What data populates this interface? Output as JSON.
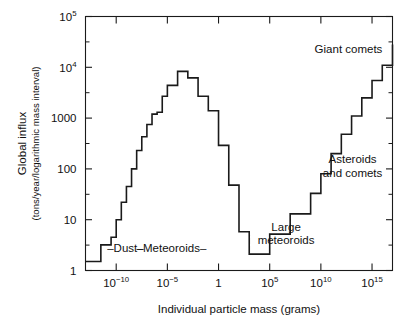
{
  "figure": {
    "background": "#ffffff",
    "line_color": "#1a1a1a",
    "axis_color": "#1a1a1a"
  },
  "chart_data": {
    "type": "line",
    "style": "step-histogram",
    "title": "",
    "xlabel": "Individual particle mass (grams)",
    "ylabel_line1": "Global influx",
    "ylabel_line2": "(tons/year/logarithmic mass interval)",
    "xscale": "log",
    "yscale": "log",
    "xlim": [
      1e-13,
      1e+17
    ],
    "ylim": [
      1,
      100000
    ],
    "grid": false,
    "legend": "none",
    "xticks_major": [
      1e-10,
      1e-05,
      1,
      100000,
      10000000000,
      1000000000000000
    ],
    "xtick_labels": [
      "10⁻¹⁰",
      "10⁻⁵",
      "1",
      "10⁵",
      "10¹⁰",
      "10¹⁵"
    ],
    "xtick_mantissas": [
      "10",
      "10",
      "1",
      "10",
      "10",
      "10"
    ],
    "xtick_exponents": [
      "-10",
      "-5",
      "",
      "5",
      "10",
      "15"
    ],
    "yticks_major": [
      1,
      10,
      100,
      1000,
      10000,
      100000
    ],
    "ytick_labels": [
      "1",
      "10",
      "100",
      "1000",
      "10⁴",
      "10⁵"
    ],
    "ytick_mantissas": [
      "1",
      "10",
      "100",
      "1000",
      "10",
      "10"
    ],
    "ytick_exponents": [
      "",
      "",
      "",
      "",
      "4",
      "5"
    ],
    "x_log_edges": [
      -13,
      -12,
      -11.5,
      -11,
      -10.5,
      -10,
      -9.5,
      -9,
      -8.5,
      -8,
      -7.5,
      -7,
      -6.5,
      -6,
      -5.5,
      -5,
      -4.5,
      -4,
      -3.5,
      -3,
      -2.5,
      -2,
      -1.5,
      -1,
      0,
      1,
      2,
      3,
      4,
      5,
      6,
      7,
      8,
      9,
      10,
      11,
      12,
      13,
      14,
      15,
      16,
      17
    ],
    "y_values": [
      1.5,
      1.5,
      3.2,
      3.2,
      4.5,
      10,
      22,
      45,
      100,
      230,
      430,
      750,
      1200,
      1300,
      2700,
      4400,
      4400,
      8300,
      8300,
      6200,
      6200,
      2700,
      2700,
      1400,
      290,
      48,
      5.8,
      2.1,
      2.1,
      5.2,
      5.2,
      13,
      13,
      33,
      80,
      200,
      480,
      1100,
      2500,
      5500,
      11000,
      28000
    ],
    "annotations": [
      {
        "name": "dust",
        "text": "–Dust–",
        "x_log": -9.1,
        "y_value": 2.3
      },
      {
        "name": "meteoroids",
        "text": "–Meteoroids–",
        "x_log": -4.6,
        "y_value": 2.3
      },
      {
        "name": "large-meteoroids",
        "text_line1": "Large",
        "text_line2": "meteoroids",
        "x_log": 6.6,
        "y_value": 6.0
      },
      {
        "name": "asteroids-and-comets",
        "text_line1": "Asteroids",
        "text_line2": "and comets",
        "x_log": 13.1,
        "y_value": 130
      },
      {
        "name": "giant-comets",
        "text": "Giant comets",
        "x_log": 12.7,
        "y_value": 19000
      }
    ]
  }
}
